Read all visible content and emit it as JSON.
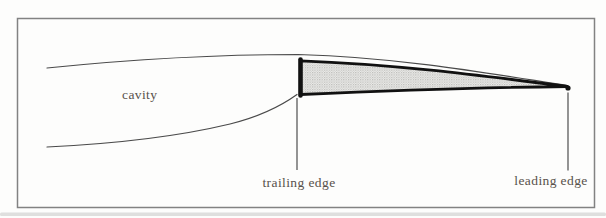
{
  "figure": {
    "type": "supercavitating-foil-diagram",
    "labels": {
      "cavity": "cavity",
      "trailing_edge": "trailing edge",
      "leading_edge": "leading edge"
    },
    "colors": {
      "background": "#fdfdfc",
      "frame": "#828282",
      "thin_line": "#4a4a4a",
      "foil_outline": "#111111",
      "foil_fill_base": "#efefed",
      "foil_fill_stipple": "#b7b7b4",
      "label_text": "#58514b",
      "scan_smudge": "#c6c6c4"
    }
  }
}
